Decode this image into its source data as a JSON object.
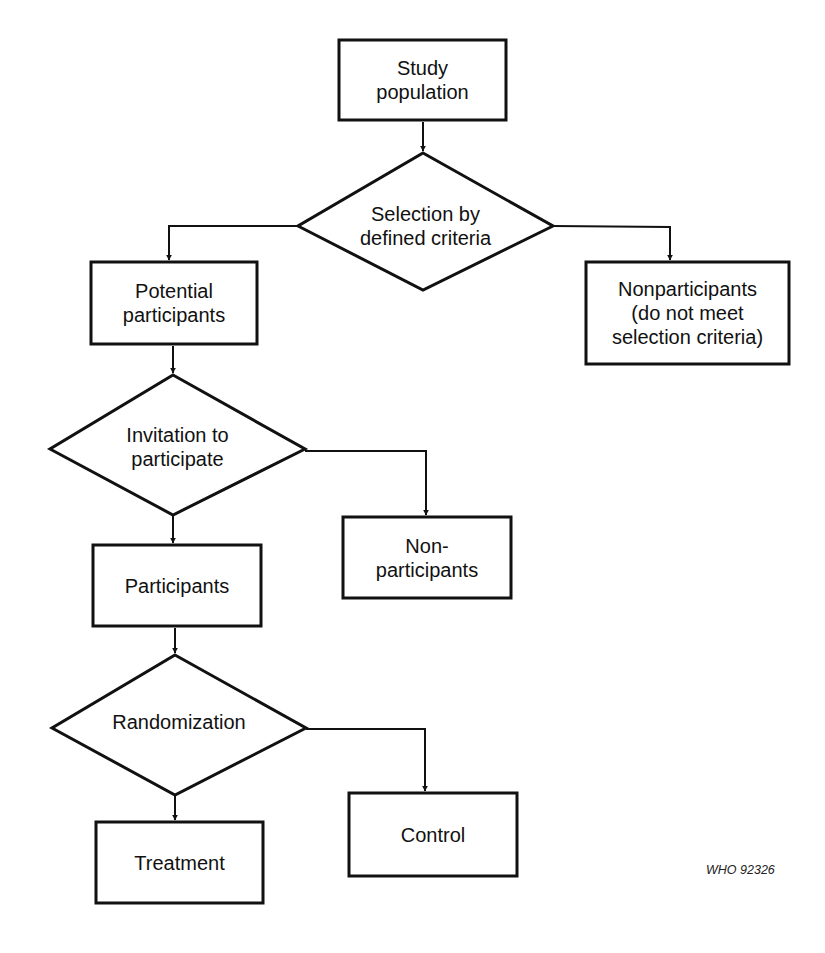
{
  "diagram": {
    "type": "flowchart",
    "nodes": [
      {
        "id": "study_population",
        "shape": "box",
        "label": "Study\npopulation"
      },
      {
        "id": "selection",
        "shape": "diamond",
        "label": "Selection by\ndefined criteria"
      },
      {
        "id": "potential_participants",
        "shape": "box",
        "label": "Potential\nparticipants"
      },
      {
        "id": "nonparticipants_selection",
        "shape": "box",
        "label": "Nonparticipants\n(do not meet\nselection criteria)"
      },
      {
        "id": "invitation",
        "shape": "diamond",
        "label": "Invitation to\nparticipate"
      },
      {
        "id": "participants",
        "shape": "box",
        "label": "Participants"
      },
      {
        "id": "non_participants",
        "shape": "box",
        "label": "Non-\nparticipants"
      },
      {
        "id": "randomization",
        "shape": "diamond",
        "label": "Randomization"
      },
      {
        "id": "treatment",
        "shape": "box",
        "label": "Treatment"
      },
      {
        "id": "control",
        "shape": "box",
        "label": "Control"
      }
    ],
    "edges": [
      {
        "from": "study_population",
        "to": "selection"
      },
      {
        "from": "selection",
        "to": "potential_participants"
      },
      {
        "from": "selection",
        "to": "nonparticipants_selection"
      },
      {
        "from": "potential_participants",
        "to": "invitation"
      },
      {
        "from": "invitation",
        "to": "participants"
      },
      {
        "from": "invitation",
        "to": "non_participants"
      },
      {
        "from": "participants",
        "to": "randomization"
      },
      {
        "from": "randomization",
        "to": "treatment"
      },
      {
        "from": "randomization",
        "to": "control"
      }
    ],
    "footer": "WHO 92326",
    "colors": {
      "stroke": "#111111",
      "background": "#ffffff"
    }
  }
}
